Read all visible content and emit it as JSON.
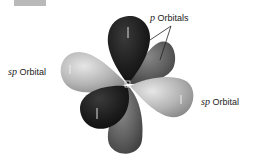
{
  "diagram": {
    "labels": {
      "p_orbitals": {
        "prefix": "p",
        "text": "Orbitals"
      },
      "sp_left": {
        "prefix": "sp",
        "text": "Orbital"
      },
      "sp_right": {
        "prefix": "sp",
        "text": "Orbital"
      },
      "center_atom": "C"
    },
    "lobe_marks": [
      "1",
      "1",
      "1",
      "1"
    ],
    "colors": {
      "p_orbital_dark": "#1c1c1c",
      "p_orbital_mid": "#5e5e5e",
      "sp_orbital_light": "#b4b4b4",
      "background": "#ffffff",
      "corner_tab": "#b9b9b9"
    }
  }
}
